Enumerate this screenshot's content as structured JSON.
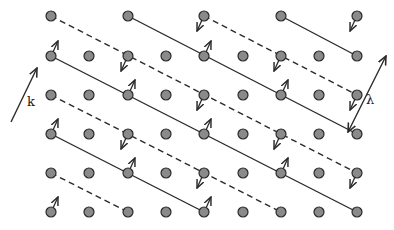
{
  "diagram": {
    "type": "crystal-lattice-wave",
    "colors": {
      "background": "#ffffff",
      "atom_fill": "#8a8a8a",
      "atom_stroke": "#2a2a2a",
      "line": "#2a2a2a"
    },
    "columns_x": [
      51,
      89,
      128,
      166,
      204,
      243,
      281,
      319,
      357
    ],
    "rows_y": [
      16,
      56,
      95,
      134,
      173,
      212
    ],
    "atoms": [
      {
        "c": 0,
        "r": 0
      },
      {
        "c": 2,
        "r": 0
      },
      {
        "c": 4,
        "r": 0
      },
      {
        "c": 6,
        "r": 0
      },
      {
        "c": 8,
        "r": 0
      },
      {
        "c": 0,
        "r": 1
      },
      {
        "c": 1,
        "r": 1
      },
      {
        "c": 2,
        "r": 1
      },
      {
        "c": 3,
        "r": 1
      },
      {
        "c": 4,
        "r": 1
      },
      {
        "c": 5,
        "r": 1
      },
      {
        "c": 6,
        "r": 1
      },
      {
        "c": 7,
        "r": 1
      },
      {
        "c": 8,
        "r": 1
      },
      {
        "c": 0,
        "r": 2
      },
      {
        "c": 1,
        "r": 2
      },
      {
        "c": 2,
        "r": 2
      },
      {
        "c": 3,
        "r": 2
      },
      {
        "c": 4,
        "r": 2
      },
      {
        "c": 5,
        "r": 2
      },
      {
        "c": 6,
        "r": 2
      },
      {
        "c": 7,
        "r": 2
      },
      {
        "c": 8,
        "r": 2
      },
      {
        "c": 0,
        "r": 3
      },
      {
        "c": 1,
        "r": 3
      },
      {
        "c": 2,
        "r": 3
      },
      {
        "c": 3,
        "r": 3
      },
      {
        "c": 4,
        "r": 3
      },
      {
        "c": 5,
        "r": 3
      },
      {
        "c": 6,
        "r": 3
      },
      {
        "c": 7,
        "r": 3
      },
      {
        "c": 8,
        "r": 3
      },
      {
        "c": 0,
        "r": 4
      },
      {
        "c": 1,
        "r": 4
      },
      {
        "c": 2,
        "r": 4
      },
      {
        "c": 3,
        "r": 4
      },
      {
        "c": 4,
        "r": 4
      },
      {
        "c": 5,
        "r": 4
      },
      {
        "c": 6,
        "r": 4
      },
      {
        "c": 7,
        "r": 4
      },
      {
        "c": 8,
        "r": 4
      },
      {
        "c": 0,
        "r": 5
      },
      {
        "c": 1,
        "r": 5
      },
      {
        "c": 2,
        "r": 5
      },
      {
        "c": 3,
        "r": 5
      },
      {
        "c": 4,
        "r": 5
      },
      {
        "c": 5,
        "r": 5
      },
      {
        "c": 6,
        "r": 5
      },
      {
        "c": 7,
        "r": 5
      },
      {
        "c": 8,
        "r": 5
      }
    ],
    "wavefronts": [
      {
        "style": "solid",
        "from": {
          "c": 2,
          "r": 0
        },
        "to": {
          "c": 8,
          "r": 3
        }
      },
      {
        "style": "solid",
        "from": {
          "c": 6,
          "r": 0
        },
        "to": {
          "c": 8,
          "r": 1
        }
      },
      {
        "style": "solid",
        "from": {
          "c": 0,
          "r": 1
        },
        "to": {
          "c": 8,
          "r": 5
        }
      },
      {
        "style": "solid",
        "from": {
          "c": 0,
          "r": 3
        },
        "to": {
          "c": 4,
          "r": 5
        }
      },
      {
        "style": "dashed",
        "from": {
          "c": 0,
          "r": 0
        },
        "to": {
          "c": 8,
          "r": 4
        }
      },
      {
        "style": "dashed",
        "from": {
          "c": 4,
          "r": 0
        },
        "to": {
          "c": 8,
          "r": 2
        }
      },
      {
        "style": "dashed",
        "from": {
          "c": 0,
          "r": 2
        },
        "to": {
          "c": 6,
          "r": 5
        }
      },
      {
        "style": "dashed",
        "from": {
          "c": 0,
          "r": 4
        },
        "to": {
          "c": 2,
          "r": 5
        }
      }
    ],
    "displacements": [
      {
        "c": 0,
        "r": 1,
        "dir": "up-right"
      },
      {
        "c": 2,
        "r": 1,
        "dir": "down-left"
      },
      {
        "c": 4,
        "r": 0,
        "dir": "down-left"
      },
      {
        "c": 4,
        "r": 1,
        "dir": "up-right"
      },
      {
        "c": 6,
        "r": 1,
        "dir": "down-left"
      },
      {
        "c": 8,
        "r": 0,
        "dir": "down-left"
      },
      {
        "c": 2,
        "r": 2,
        "dir": "up-right"
      },
      {
        "c": 4,
        "r": 2,
        "dir": "down-left"
      },
      {
        "c": 6,
        "r": 2,
        "dir": "up-right"
      },
      {
        "c": 8,
        "r": 2,
        "dir": "down-left"
      },
      {
        "c": 0,
        "r": 3,
        "dir": "up-right"
      },
      {
        "c": 2,
        "r": 3,
        "dir": "down-left"
      },
      {
        "c": 4,
        "r": 3,
        "dir": "up-right"
      },
      {
        "c": 6,
        "r": 3,
        "dir": "down-left"
      },
      {
        "c": 2,
        "r": 4,
        "dir": "up-right"
      },
      {
        "c": 4,
        "r": 4,
        "dir": "down-left"
      },
      {
        "c": 6,
        "r": 4,
        "dir": "up-right"
      },
      {
        "c": 8,
        "r": 4,
        "dir": "down-left"
      },
      {
        "c": 0,
        "r": 5,
        "dir": "up-right"
      },
      {
        "c": 4,
        "r": 5,
        "dir": "up-right"
      }
    ],
    "wave_vector": {
      "label": "k",
      "from": [
        11,
        122
      ],
      "to": [
        37,
        68
      ],
      "label_pos": [
        27,
        106
      ]
    },
    "wavelength": {
      "label": "λ",
      "from": [
        348,
        132
      ],
      "to": [
        386,
        56
      ],
      "label_pos": [
        366,
        104
      ]
    }
  }
}
